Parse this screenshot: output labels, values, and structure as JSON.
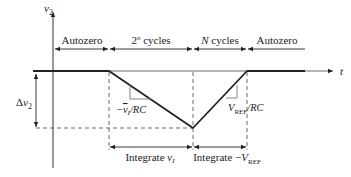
{
  "diagram": {
    "axes": {
      "y_label": "v",
      "y_label_sub": "2",
      "x_label": "t"
    },
    "phases": [
      {
        "label": "Autozero"
      },
      {
        "label_main": "2",
        "label_sup": "n",
        "label_rest": " cycles"
      },
      {
        "label_main": "N",
        "label_rest": " cycles"
      },
      {
        "label": "Autozero"
      }
    ],
    "delta_label": {
      "prefix": "Δ",
      "var": "v",
      "sub": "2"
    },
    "slopes": {
      "down": {
        "prefix": "−",
        "var": "v",
        "sub": "I",
        "suffix": "/RC"
      },
      "up": {
        "var": "V",
        "sub": "REF",
        "suffix": "/RC"
      }
    },
    "integrate": {
      "first": {
        "text": "Integrate ",
        "var": "v",
        "sub": "I"
      },
      "second": {
        "text": "Integrate −",
        "var": "V",
        "sub": "REF"
      }
    },
    "colors": {
      "line": "#222222",
      "slope_triangle": "#777777",
      "dashed": "#444444"
    }
  }
}
